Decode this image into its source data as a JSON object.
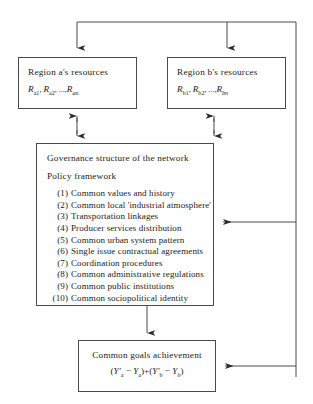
{
  "diagram": {
    "line_color": "#4a4a4a"
  },
  "region_a": {
    "title": "Region a's resources",
    "symbol": "R",
    "sub1": "a1",
    "sub2": "a2",
    "ellipsis": ", ...,",
    "sub_n": "an",
    "formula_plain": "R_a1, R_a2, ..., R_an"
  },
  "region_b": {
    "title": "Region b's resources",
    "symbol": "R",
    "sub1": "b1",
    "sub2": "b2",
    "ellipsis": ", ...,",
    "sub_n": "bn",
    "formula_plain": "R_b1, R_b2, ..., R_bn"
  },
  "governance": {
    "heading": "Governance structure of the network",
    "subheading": "Policy framework",
    "items": [
      {
        "num": "(1)",
        "label": "Common values and history"
      },
      {
        "num": "(2)",
        "label": "Common local 'industrial atmosphere'"
      },
      {
        "num": "(3)",
        "label": "Transportation linkages"
      },
      {
        "num": "(4)",
        "label": "Producer services distribution"
      },
      {
        "num": "(5)",
        "label": "Common urban system pattern"
      },
      {
        "num": "(6)",
        "label": "Single issue contractual agreements"
      },
      {
        "num": "(7)",
        "label": "Coordination procedures"
      },
      {
        "num": "(8)",
        "label": "Common administrative regulations"
      },
      {
        "num": "(9)",
        "label": "Common public institutions"
      },
      {
        "num": "(10)",
        "label": "Common sociopolitical identity"
      }
    ]
  },
  "goals": {
    "title": "Common goals achievement",
    "formula_plain": "(Y'a − Ya) + (Y'b − Yb)",
    "open1": "(",
    "y1": "Y′",
    "y1sub": "a",
    "minus1": " − ",
    "y2": "Y",
    "y2sub": "a",
    "close1": ")",
    "plus": "+",
    "open2": "(",
    "y3": "Y′",
    "y3sub": "b",
    "minus2": " − ",
    "y4": "Y",
    "y4sub": "b",
    "close2": ")"
  },
  "connectors": [
    {
      "name": "feedback-top-to-region-a",
      "desc": "arrow down into Region a's resources"
    },
    {
      "name": "feedback-top-to-region-b",
      "desc": "arrow down into Region b's resources"
    },
    {
      "name": "region-a-governance-link",
      "desc": "double headed arrow between Region a and governance"
    },
    {
      "name": "region-b-governance-link",
      "desc": "double headed arrow between Region b and governance"
    },
    {
      "name": "governance-to-goals",
      "desc": "arrow down into Common goals achievement"
    },
    {
      "name": "feedback-right-to-governance",
      "desc": "arrow left into governance box"
    },
    {
      "name": "feedback-right-to-goals",
      "desc": "arrow left into goals box"
    }
  ]
}
